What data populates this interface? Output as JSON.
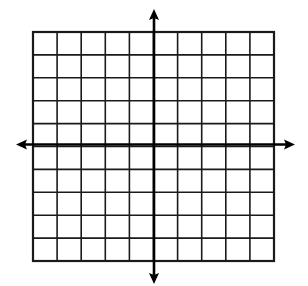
{
  "diagram": {
    "type": "coordinate-grid",
    "grid": {
      "columns": 10,
      "rows": 10,
      "left": 33,
      "top": 32,
      "right": 274,
      "bottom": 261,
      "line_color": "#1a1a1a",
      "line_width": 1.6,
      "border_width": 2.2
    },
    "axes": {
      "origin_x": 154,
      "origin_y": 144.5,
      "color": "#000000",
      "width": 2.6,
      "x_axis": {
        "left_tip": 16,
        "right_tip": 295
      },
      "y_axis": {
        "top_tip": 9,
        "bottom_tip": 284
      }
    },
    "labels": []
  }
}
